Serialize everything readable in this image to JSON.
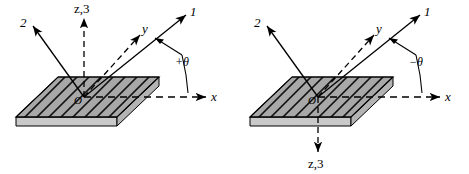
{
  "figure": {
    "background": "#ffffff",
    "stroke_color": "#000000",
    "plate_face_color": "#a8a8a8",
    "plate_edge_color": "#c9c9c9",
    "hatch_color": "#1a1a1a"
  },
  "panels": [
    {
      "id": "left",
      "name": "positive-angle-diagram",
      "angle_label": "+θ",
      "axes": [
        {
          "name": "axis-1",
          "label": "1",
          "kind": "material-axis",
          "style": "solid"
        },
        {
          "name": "axis-2",
          "label": "2",
          "kind": "material-axis",
          "style": "solid"
        },
        {
          "name": "axis-z3",
          "label": "z,3",
          "kind": "material-axis",
          "style": "dashed",
          "direction": "up"
        },
        {
          "name": "axis-y",
          "label": "y",
          "kind": "global-axis",
          "style": "dashed"
        },
        {
          "name": "axis-x",
          "label": "x",
          "kind": "global-axis",
          "style": "dashed"
        }
      ],
      "origin_label": "O",
      "fiber_direction_deg": 30
    },
    {
      "id": "right",
      "name": "negative-angle-diagram",
      "angle_label": "−θ",
      "axes": [
        {
          "name": "axis-1",
          "label": "1",
          "kind": "material-axis",
          "style": "solid"
        },
        {
          "name": "axis-2",
          "label": "2",
          "kind": "material-axis",
          "style": "solid"
        },
        {
          "name": "axis-z3",
          "label": "z,3",
          "kind": "material-axis",
          "style": "dashed",
          "direction": "down"
        },
        {
          "name": "axis-y",
          "label": "y",
          "kind": "global-axis",
          "style": "dashed"
        },
        {
          "name": "axis-x",
          "label": "x",
          "kind": "global-axis",
          "style": "dashed"
        }
      ],
      "origin_label": "O",
      "fiber_direction_deg": 30
    }
  ]
}
